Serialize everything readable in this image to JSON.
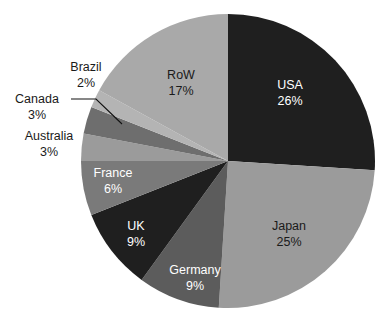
{
  "chart_data": {
    "type": "pie",
    "title": "",
    "subtitle": "",
    "xlabel": "",
    "ylabel": "",
    "legend_position": "none",
    "grid": false,
    "labels_show_percent": true,
    "start_angle_deg": 0,
    "direction": "clockwise",
    "categories": [
      "USA",
      "Japan",
      "Germany",
      "UK",
      "France",
      "Australia",
      "Canada",
      "Brazil",
      "RoW"
    ],
    "values": [
      26,
      25,
      9,
      9,
      6,
      3,
      3,
      2,
      17
    ],
    "unit": "%",
    "slices": [
      {
        "name": "USA",
        "label": "USA",
        "value": 26,
        "value_text": "26%",
        "color": "#1f1f1f",
        "text_color": "#ffffff",
        "label_placement": "inside",
        "label_x": 290,
        "label_y": 86,
        "value_x": 290,
        "value_y": 102
      },
      {
        "name": "Japan",
        "label": "Japan",
        "value": 25,
        "value_text": "25%",
        "color": "#9b9b9b",
        "text_color": "#1a1a1a",
        "label_placement": "inside",
        "label_x": 289,
        "label_y": 227,
        "value_x": 289,
        "value_y": 243
      },
      {
        "name": "Germany",
        "label": "Germany",
        "value": 9,
        "value_text": "9%",
        "color": "#5c5c5c",
        "text_color": "#ffffff",
        "label_placement": "inside",
        "label_x": 195,
        "label_y": 271,
        "value_x": 195,
        "value_y": 287
      },
      {
        "name": "UK",
        "label": "UK",
        "value": 9,
        "value_text": "9%",
        "color": "#1f1f1f",
        "text_color": "#ffffff",
        "label_placement": "inside",
        "label_x": 136,
        "label_y": 227,
        "value_x": 136,
        "value_y": 243
      },
      {
        "name": "France",
        "label": "France",
        "value": 6,
        "value_text": "6%",
        "color": "#7a7a7a",
        "text_color": "#ffffff",
        "label_placement": "inside",
        "label_x": 113,
        "label_y": 174,
        "value_x": 113,
        "value_y": 190
      },
      {
        "name": "Australia",
        "label": "Australia",
        "value": 3,
        "value_text": "3%",
        "color": "#9b9b9b",
        "text_color": "#1a1a1a",
        "label_placement": "outside",
        "label_x": 49,
        "label_y": 137,
        "value_x": 49,
        "value_y": 153
      },
      {
        "name": "Canada",
        "label": "Canada",
        "value": 3,
        "value_text": "3%",
        "color": "#6e6e6e",
        "text_color": "#1a1a1a",
        "label_placement": "outside",
        "label_x": 37,
        "label_y": 100,
        "value_x": 37,
        "value_y": 116,
        "has_leader_line": true
      },
      {
        "name": "Brazil",
        "label": "Brazil",
        "value": 2,
        "value_text": "2%",
        "color": "#b4b4b4",
        "text_color": "#1a1a1a",
        "label_placement": "outside",
        "label_x": 86,
        "label_y": 68,
        "value_x": 86,
        "value_y": 84
      },
      {
        "name": "RoW",
        "label": "RoW",
        "value": 17,
        "value_text": "17%",
        "color": "#a9a9a9",
        "text_color": "#1a1a1a",
        "label_placement": "inside",
        "label_x": 181,
        "label_y": 76,
        "value_x": 181,
        "value_y": 92
      }
    ]
  },
  "geometry": {
    "center_x": 228,
    "center_y": 161,
    "radius": 147
  },
  "colors": {
    "background": "#ffffff",
    "dark": "#1f1f1f",
    "mid_dark": "#5c5c5c",
    "mid": "#7a7a7a",
    "light": "#9b9b9b",
    "lighter": "#b4b4b4",
    "label_dark": "#1a1a1a",
    "label_light": "#ffffff"
  }
}
